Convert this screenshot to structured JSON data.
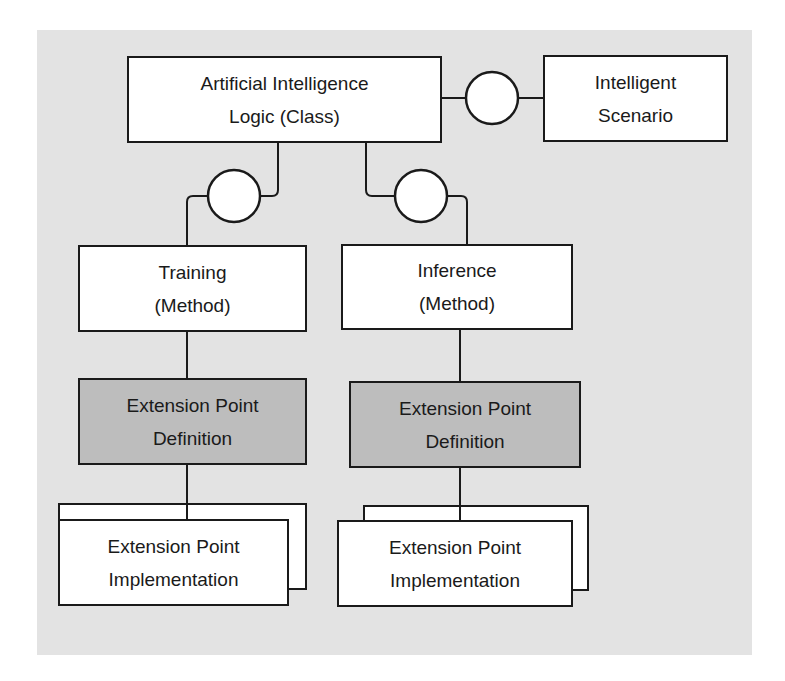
{
  "diagram": {
    "background_color": "#e3e3e3",
    "definition_fill": "#bdbdbd",
    "line_color": "#1a1a1a",
    "ai_logic": {
      "line1": "Artificial Intelligence",
      "line2": "Logic (Class)"
    },
    "scenario": {
      "line1": "Intelligent",
      "line2": "Scenario"
    },
    "training": {
      "line1": "Training",
      "line2": "(Method)"
    },
    "inference": {
      "line1": "Inference",
      "line2": "(Method)"
    },
    "training_definition": {
      "line1": "Extension Point",
      "line2": "Definition"
    },
    "inference_definition": {
      "line1": "Extension Point",
      "line2": "Definition"
    },
    "training_implementation": {
      "line1": "Extension Point",
      "line2": "Implementation"
    },
    "inference_implementation": {
      "line1": "Extension Point",
      "line2": "Implementation"
    },
    "interfaces": [
      {
        "name": "scenario-interface",
        "between": [
          "ai_logic",
          "scenario"
        ]
      },
      {
        "name": "training-interface",
        "between": [
          "ai_logic",
          "training"
        ]
      },
      {
        "name": "inference-interface",
        "between": [
          "ai_logic",
          "inference"
        ]
      }
    ]
  }
}
